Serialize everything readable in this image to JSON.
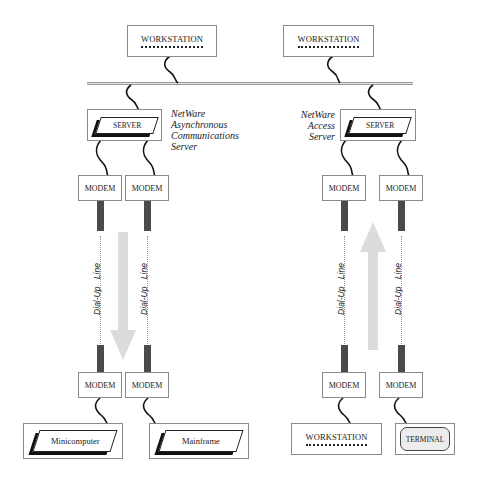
{
  "top": {
    "workstation_left": "WORKSTATION",
    "workstation_right": "WORKSTATION"
  },
  "left_side": {
    "server_label": "SERVER",
    "caption": [
      "NetWare",
      "Asynchronous",
      "Communications",
      "Server"
    ],
    "modems_top": [
      "MODEM",
      "MODEM"
    ],
    "modems_bottom": [
      "MODEM",
      "MODEM"
    ],
    "dial_up_lines": [
      "Dial-Up  Line",
      "Dial-Up  Line"
    ],
    "arrow_direction": "down",
    "endpoints": [
      "Minicomputer",
      "Mainframe"
    ]
  },
  "right_side": {
    "server_label": "SERVER",
    "caption": [
      "NetWare",
      "Access",
      "Server"
    ],
    "modems_top": [
      "MODEM",
      "MODEM"
    ],
    "modems_bottom": [
      "MODEM",
      "MODEM"
    ],
    "dial_up_lines": [
      "Dial-Up  Line",
      "Dial-Up  Line"
    ],
    "arrow_direction": "up",
    "endpoints": [
      "WORKSTATION",
      "TERMINAL"
    ]
  },
  "colors": {
    "cable": "#4a4a4a",
    "arrow": "#dcdcdc",
    "bus": "#9a9a9a",
    "box_border": "#8a8a8a"
  }
}
